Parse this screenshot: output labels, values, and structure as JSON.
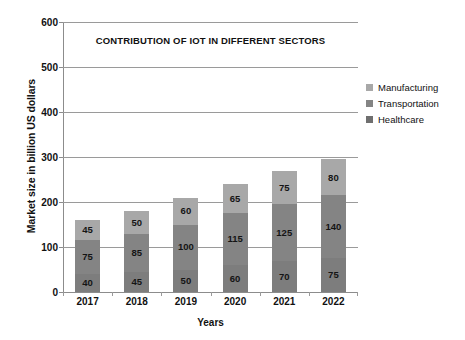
{
  "chart_data": {
    "type": "bar",
    "subtype": "stacked-bar",
    "title": "CONTRIBUTION OF IOT IN DIFFERENT SECTORS",
    "xlabel": "Years",
    "ylabel": "Market size in billion US dollars",
    "categories": [
      "2017",
      "2018",
      "2019",
      "2020",
      "2021",
      "2022"
    ],
    "ylim": [
      0,
      600
    ],
    "yticks": [
      0,
      100,
      200,
      300,
      400,
      500,
      600
    ],
    "ytick_labels": [
      "0",
      "100",
      "200",
      "300",
      "400",
      "500",
      "600"
    ],
    "grid": true,
    "grid_axis": "y",
    "legend_position": "right",
    "stack_order_bottom_to_top": [
      "Healthcare",
      "Transportation",
      "Manufacturing"
    ],
    "series": [
      {
        "name": "Healthcare",
        "color": "#7d7d7d",
        "values": [
          40,
          45,
          50,
          60,
          70,
          75
        ],
        "labels": [
          "40",
          "45",
          "50",
          "60",
          "70",
          "75"
        ]
      },
      {
        "name": "Transportation",
        "color": "#848484",
        "values": [
          75,
          85,
          100,
          115,
          125,
          140
        ],
        "labels": [
          "75",
          "85",
          "100",
          "115",
          "125",
          "140"
        ]
      },
      {
        "name": "Manufacturing",
        "color": "#a8a8a8",
        "values": [
          45,
          50,
          60,
          65,
          75,
          80
        ],
        "labels": [
          "45",
          "50",
          "60",
          "65",
          "75",
          "80"
        ]
      }
    ],
    "totals": [
      160,
      180,
      210,
      240,
      270,
      295
    ]
  },
  "legend": {
    "items": [
      {
        "label": "Manufacturing",
        "color": "#a8a8a8"
      },
      {
        "label": "Transportation",
        "color": "#848484"
      },
      {
        "label": "Healthcare",
        "color": "#6f6f6f"
      }
    ]
  }
}
